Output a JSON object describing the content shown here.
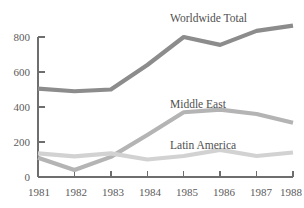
{
  "chart_data": {
    "type": "line",
    "title": "",
    "subtitle": "",
    "xlabel": "",
    "ylabel": "",
    "categories": [
      "1981",
      "1982",
      "1983",
      "1984",
      "1985",
      "1986",
      "1987",
      "1988"
    ],
    "x": [
      1981,
      1982,
      1983,
      1984,
      1985,
      1986,
      1987,
      1988
    ],
    "xlim": [
      1981,
      1988
    ],
    "ylim": [
      0,
      880
    ],
    "y_ticks": [
      0,
      200,
      400,
      600,
      800
    ],
    "y_tick_labels": [
      "0",
      "200",
      "400",
      "600",
      "800"
    ],
    "x_ticks": [
      1981,
      1982,
      1983,
      1984,
      1985,
      1986,
      1987,
      1988
    ],
    "x_tick_labels": [
      "1981",
      "1982",
      "1983",
      "1984",
      "1985",
      "1986",
      "1987",
      "1988"
    ],
    "grid": false,
    "legend_position": "inline-annotations",
    "series": [
      {
        "name": "Worldwide Total",
        "color": "#8c8c8c",
        "values": [
          505,
          490,
          500,
          640,
          800,
          755,
          835,
          865
        ]
      },
      {
        "name": "Middle East",
        "color": "#b4b4b4",
        "values": [
          110,
          40,
          115,
          240,
          370,
          385,
          360,
          310
        ]
      },
      {
        "name": "Latin America",
        "color": "#d2d2d2",
        "values": [
          135,
          118,
          135,
          100,
          120,
          155,
          120,
          140
        ]
      }
    ],
    "annotations": [
      {
        "text": "Worldwide Total",
        "series": "Worldwide Total",
        "x_px": 196,
        "y_px": 18
      },
      {
        "text": "Middle East",
        "series": "Middle East",
        "x_px": 196,
        "y_px": 103
      },
      {
        "text": "Latin America",
        "series": "Latin America",
        "x_px": 196,
        "y_px": 145
      }
    ],
    "axis_color": "#6e6e6e",
    "background_color": "#ffffff",
    "text_color": "#5b5b5b"
  },
  "axes": {
    "y_labels": [
      "800",
      "600",
      "400",
      "200",
      "0"
    ],
    "x_labels": [
      "1981",
      "1982",
      "1983",
      "1984",
      "1985",
      "1986",
      "1987",
      "1988"
    ]
  },
  "labels": {
    "worldwide_total": "Worldwide Total",
    "middle_east": "Middle East",
    "latin_america": "Latin America"
  }
}
